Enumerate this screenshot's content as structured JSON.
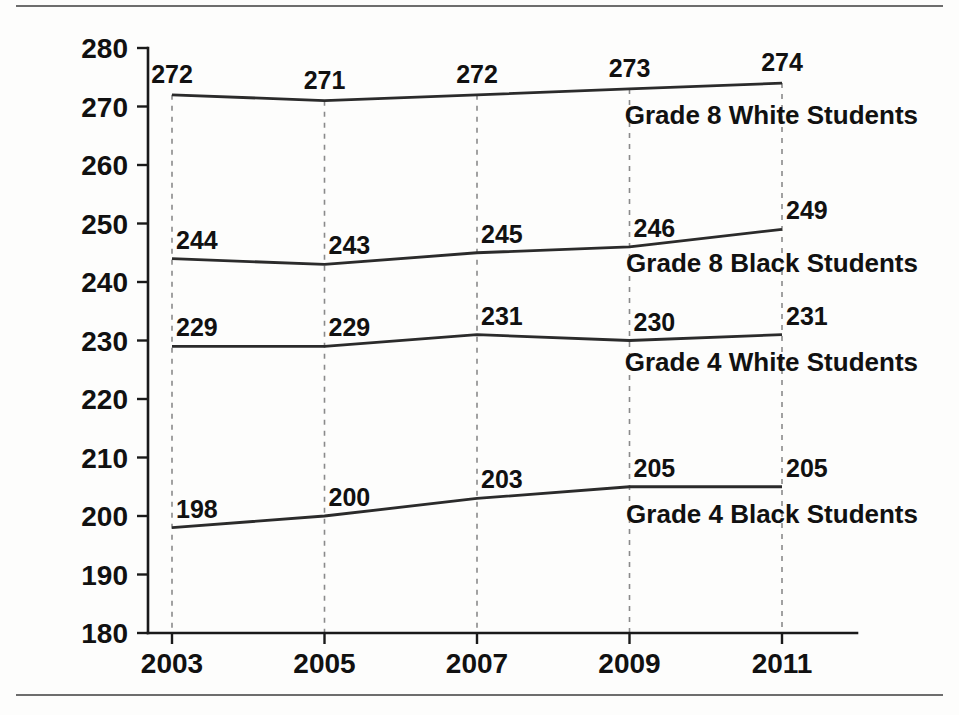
{
  "chart_data": {
    "type": "line",
    "title": "",
    "xlabel": "",
    "ylabel": "",
    "categories": [
      "2003",
      "2005",
      "2007",
      "2009",
      "2011"
    ],
    "x": [
      2003,
      2005,
      2007,
      2009,
      2011
    ],
    "ylim": [
      180,
      280
    ],
    "xlim": [
      2003,
      2011
    ],
    "yticks": [
      "280",
      "270",
      "260",
      "250",
      "240",
      "230",
      "220",
      "210",
      "200",
      "190",
      "180"
    ],
    "ytick_values": [
      280,
      270,
      260,
      250,
      240,
      230,
      220,
      210,
      200,
      190,
      180
    ],
    "grid": "vertical-dashed-at-each-year",
    "legend_position": "inline-right-below-each-line",
    "series": [
      {
        "name": "Grade 8 White Students",
        "values": [
          272,
          271,
          272,
          273,
          274
        ],
        "label_anchor": "middle",
        "label_dy": -12,
        "legend_y": 124
      },
      {
        "name": "Grade 8 Black Students",
        "values": [
          244,
          243,
          245,
          246,
          249
        ],
        "label_anchor": "start",
        "label_dy": -10,
        "legend_y": 272
      },
      {
        "name": "Grade 4 White Students",
        "values": [
          229,
          229,
          231,
          230,
          231
        ],
        "label_anchor": "start",
        "label_dy": -10,
        "legend_y": 371
      },
      {
        "name": "Grade 4 Black Students",
        "values": [
          198,
          200,
          203,
          205,
          205
        ],
        "label_anchor": "start",
        "label_dy": -10,
        "legend_y": 523
      }
    ],
    "colors": {
      "line": "#2b2b2b",
      "grid": "#8a8a8a",
      "axis": "#1a1a1a",
      "text": "#111111",
      "background": "#fdfdfc",
      "rule": "#6d6d6d"
    }
  }
}
